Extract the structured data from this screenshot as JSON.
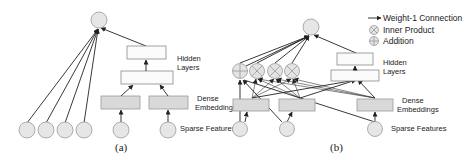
{
  "figure": {
    "panel_a": {
      "caption": "(a)",
      "labels": {
        "hidden_layers_1": "Hidden",
        "hidden_layers_2": "Layers",
        "dense_embeddings_1": "Dense",
        "dense_embeddings_2": "Embeddings",
        "sparse_features": "Sparse Features"
      }
    },
    "panel_b": {
      "caption": "(b)",
      "labels": {
        "hidden_layers_1": "Hidden",
        "hidden_layers_2": "Layers",
        "dense_embeddings_1": "Dense",
        "dense_embeddings_2": "Embeddings",
        "sparse_features": "Sparse Features"
      }
    },
    "legend": {
      "items": [
        {
          "icon": "arrow-icon",
          "label": "Weight-1 Connection"
        },
        {
          "icon": "inner-product-icon",
          "label": "Inner Product"
        },
        {
          "icon": "addition-icon",
          "label": "Addition"
        }
      ]
    },
    "colors": {
      "node_fill": "#e6e6e6",
      "embedding_fill": "#d9d9d9",
      "hidden_fill": "#fbfbfb",
      "edge": "#222222"
    }
  }
}
